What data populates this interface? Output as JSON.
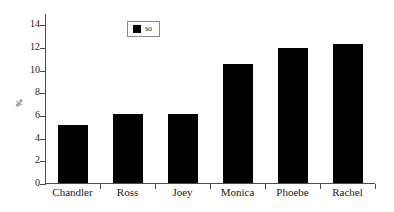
{
  "chart_data": {
    "type": "bar",
    "title": "",
    "xlabel": "",
    "ylabel": "%",
    "categories": [
      "Chandler",
      "Ross",
      "Joey",
      "Monica",
      "Phoebe",
      "Rachel"
    ],
    "values": [
      5.1,
      6.05,
      6.05,
      10.5,
      11.9,
      12.3
    ],
    "series": [
      {
        "name": "so",
        "values": [
          5.1,
          6.05,
          6.05,
          10.5,
          11.9,
          12.3
        ]
      }
    ],
    "ylim": [
      0,
      15
    ],
    "yticks": [
      0,
      2,
      4,
      6,
      8,
      10,
      12,
      14
    ],
    "ytick_labels": [
      "0",
      "2",
      "4",
      "6",
      "8",
      "10",
      "12",
      "14"
    ],
    "grid": false,
    "legend": {
      "position": "top-left-inside",
      "entries": [
        {
          "label": "so",
          "color": "#000000"
        }
      ]
    },
    "bar_color": "#000000",
    "axis_color": "#4a4a4a",
    "background": "#ffffff"
  }
}
